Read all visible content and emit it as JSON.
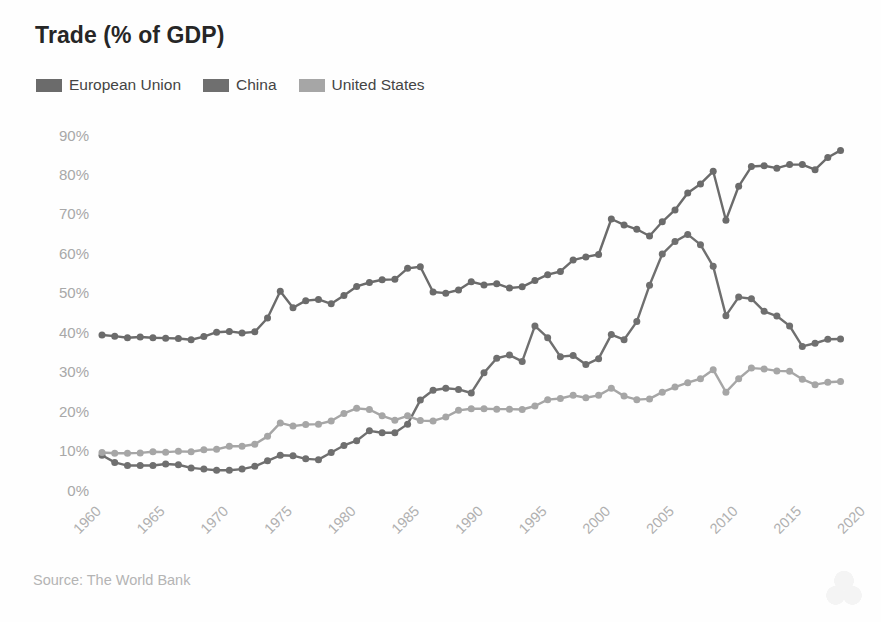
{
  "chart_data": {
    "type": "line",
    "title": "Trade (% of GDP)",
    "xlabel": "",
    "ylabel": "",
    "source": "Source: The World Bank",
    "grid": false,
    "legend_position": "top-left",
    "xlim": [
      1960,
      2020
    ],
    "ylim": [
      0,
      90
    ],
    "ytick_labels": [
      "90%",
      "80%",
      "70%",
      "60%",
      "50%",
      "40%",
      "30%",
      "20%",
      "10%",
      "0%"
    ],
    "ytick_values": [
      90,
      80,
      70,
      60,
      50,
      40,
      30,
      20,
      10,
      0
    ],
    "xtick_labels": [
      "1960",
      "1965",
      "1970",
      "1975",
      "1980",
      "1985",
      "1990",
      "1995",
      "2000",
      "2005",
      "2010",
      "2015",
      "2020"
    ],
    "xtick_values": [
      1960,
      1965,
      1970,
      1975,
      1980,
      1985,
      1990,
      1995,
      2000,
      2005,
      2010,
      2015,
      2020
    ],
    "x": [
      1960,
      1961,
      1962,
      1963,
      1964,
      1965,
      1966,
      1967,
      1968,
      1969,
      1970,
      1971,
      1972,
      1973,
      1974,
      1975,
      1976,
      1977,
      1978,
      1979,
      1980,
      1981,
      1982,
      1983,
      1984,
      1985,
      1986,
      1987,
      1988,
      1989,
      1990,
      1991,
      1992,
      1993,
      1994,
      1995,
      1996,
      1997,
      1998,
      1999,
      2000,
      2001,
      2002,
      2003,
      2004,
      2005,
      2006,
      2007,
      2008,
      2009,
      2010,
      2011,
      2012,
      2013,
      2014,
      2015,
      2016,
      2017,
      2018
    ],
    "series": [
      {
        "name": "European Union",
        "color": "#6b6b6b",
        "values": [
          39.3,
          39.0,
          38.6,
          38.8,
          38.6,
          38.5,
          38.4,
          38.1,
          38.9,
          40.0,
          40.2,
          39.8,
          40.1,
          43.6,
          50.4,
          46.2,
          48.0,
          48.3,
          47.2,
          49.3,
          51.6,
          52.6,
          53.3,
          53.4,
          56.2,
          56.6,
          50.2,
          49.9,
          50.7,
          52.8,
          52.0,
          52.3,
          51.2,
          51.5,
          53.1,
          54.6,
          55.4,
          58.3,
          59.1,
          59.7,
          68.7,
          67.2,
          66.1,
          64.4,
          68.0,
          71.0,
          75.3,
          77.6,
          80.8,
          68.4,
          77.0,
          82.0,
          82.2,
          81.6,
          82.5,
          82.5,
          81.2,
          84.3,
          86.1
        ]
      },
      {
        "name": "China",
        "color": "#6f6f6f",
        "values": [
          8.8,
          7.0,
          6.2,
          6.2,
          6.2,
          6.6,
          6.4,
          5.6,
          5.3,
          5.0,
          5.0,
          5.3,
          6.0,
          7.4,
          8.8,
          8.7,
          7.9,
          7.7,
          9.5,
          11.3,
          12.5,
          15.0,
          14.5,
          14.5,
          16.7,
          22.8,
          25.3,
          25.8,
          25.5,
          24.6,
          29.7,
          33.4,
          34.2,
          32.6,
          41.6,
          38.6,
          33.8,
          34.1,
          31.8,
          33.3,
          39.4,
          38.1,
          42.7,
          51.9,
          59.8,
          63.0,
          64.8,
          62.2,
          56.7,
          44.2,
          48.9,
          48.5,
          45.3,
          44.1,
          41.6,
          36.4,
          37.2,
          38.2,
          38.3
        ]
      },
      {
        "name": "United States",
        "color": "#a6a6a6",
        "values": [
          9.5,
          9.3,
          9.3,
          9.4,
          9.7,
          9.6,
          9.8,
          9.7,
          10.2,
          10.3,
          11.1,
          11.1,
          11.6,
          13.6,
          17.0,
          16.2,
          16.6,
          16.7,
          17.5,
          19.4,
          20.7,
          20.4,
          18.8,
          17.7,
          18.8,
          17.6,
          17.5,
          18.5,
          20.2,
          20.6,
          20.6,
          20.5,
          20.5,
          20.4,
          21.3,
          22.9,
          23.2,
          24.0,
          23.4,
          24.0,
          25.8,
          23.8,
          22.9,
          23.1,
          24.8,
          26.1,
          27.2,
          28.2,
          30.5,
          24.8,
          28.2,
          30.9,
          30.7,
          30.2,
          30.1,
          28.1,
          26.7,
          27.3,
          27.5
        ]
      }
    ]
  },
  "legend": {
    "items": [
      {
        "label": "European Union",
        "color": "#6b6b6b"
      },
      {
        "label": "China",
        "color": "#6f6f6f"
      },
      {
        "label": "United States",
        "color": "#a6a6a6"
      }
    ]
  },
  "footer": {
    "source": "Source: The World Bank"
  },
  "watermark": {
    "name": "faint-logo-watermark"
  }
}
